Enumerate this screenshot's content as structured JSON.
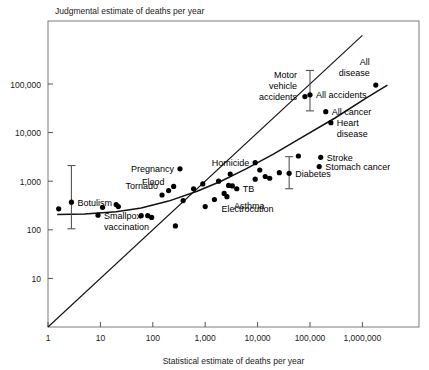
{
  "chart_data": {
    "type": "scatter",
    "title": "",
    "ylabel": "Judgmental estimate of deaths per year",
    "xlabel": "Statistical estimate of deaths per year",
    "xscale": "log",
    "yscale": "log",
    "xlim": [
      1,
      5000000
    ],
    "ylim": [
      1,
      1000000
    ],
    "grid": false,
    "legend": null,
    "xticks": [
      {
        "value": 1,
        "label": "1"
      },
      {
        "value": 10,
        "label": "10"
      },
      {
        "value": 100,
        "label": "100"
      },
      {
        "value": 1000,
        "label": "1,000"
      },
      {
        "value": 10000,
        "label": "10,000"
      },
      {
        "value": 100000,
        "label": "100,000"
      },
      {
        "value": 1000000,
        "label": "1,000,000"
      }
    ],
    "yticks": [
      {
        "value": 10,
        "label": "10"
      },
      {
        "value": 100,
        "label": "100"
      },
      {
        "value": 1000,
        "label": "1,000"
      },
      {
        "value": 10000,
        "label": "10,000"
      },
      {
        "value": 100000,
        "label": "100,000"
      }
    ],
    "reference_line": {
      "name": "identity-line",
      "from": [
        1,
        1
      ],
      "to": [
        1000000,
        1000000
      ]
    },
    "fit_curve": {
      "name": "fitted-curve",
      "points": [
        [
          1.5,
          205
        ],
        [
          5,
          212
        ],
        [
          20,
          235
        ],
        [
          60,
          280
        ],
        [
          200,
          390
        ],
        [
          700,
          620
        ],
        [
          2000,
          1000
        ],
        [
          6000,
          1800
        ],
        [
          20000,
          3600
        ],
        [
          70000,
          8000
        ],
        [
          300000,
          20000
        ],
        [
          1200000,
          52000
        ],
        [
          3000000,
          95000
        ]
      ]
    },
    "points": [
      {
        "x": 1.6,
        "y": 270,
        "label": ""
      },
      {
        "x": 2.8,
        "y": 370,
        "label": "Botulism",
        "label_pos": "right",
        "error_bar": {
          "low": 105,
          "high": 2100
        }
      },
      {
        "x": 11,
        "y": 290,
        "label": ""
      },
      {
        "x": 9,
        "y": 200,
        "label": "Smallpox vaccination",
        "label_pos": "right-2line"
      },
      {
        "x": 20,
        "y": 330,
        "label": ""
      },
      {
        "x": 22,
        "y": 300,
        "label": ""
      },
      {
        "x": 60,
        "y": 195,
        "label": ""
      },
      {
        "x": 80,
        "y": 195,
        "label": ""
      },
      {
        "x": 95,
        "y": 180,
        "label": ""
      },
      {
        "x": 150,
        "y": 520,
        "label": "Tornado",
        "label_pos": "above"
      },
      {
        "x": 200,
        "y": 640,
        "label": "Flood",
        "label_pos": "above"
      },
      {
        "x": 250,
        "y": 780,
        "label": ""
      },
      {
        "x": 330,
        "y": 1800,
        "label": "Pregnancy",
        "label_pos": "left"
      },
      {
        "x": 270,
        "y": 120,
        "label": ""
      },
      {
        "x": 380,
        "y": 400,
        "label": ""
      },
      {
        "x": 600,
        "y": 700,
        "label": ""
      },
      {
        "x": 900,
        "y": 880,
        "label": ""
      },
      {
        "x": 1000,
        "y": 300,
        "label": ""
      },
      {
        "x": 1800,
        "y": 1000,
        "label": ""
      },
      {
        "x": 2300,
        "y": 560,
        "label": ""
      },
      {
        "x": 2800,
        "y": 820,
        "label": ""
      },
      {
        "x": 3300,
        "y": 800,
        "label": ""
      },
      {
        "x": 4000,
        "y": 700,
        "label": "TB",
        "label_pos": "right"
      },
      {
        "x": 2600,
        "y": 480,
        "label": "Asthma",
        "label_pos": "below"
      },
      {
        "x": 1500,
        "y": 420,
        "label": "Electrocution",
        "label_pos": "below"
      },
      {
        "x": 3000,
        "y": 1400,
        "label": ""
      },
      {
        "x": 9000,
        "y": 2400,
        "label": "Homicide",
        "label_pos": "left"
      },
      {
        "x": 11000,
        "y": 1700,
        "label": ""
      },
      {
        "x": 9000,
        "y": 1100,
        "label": ""
      },
      {
        "x": 14000,
        "y": 1250,
        "label": ""
      },
      {
        "x": 17000,
        "y": 1150,
        "label": ""
      },
      {
        "x": 26000,
        "y": 1500,
        "label": ""
      },
      {
        "x": 40000,
        "y": 1450,
        "label": "Diabetes",
        "label_pos": "right",
        "error_bar": {
          "low": 700,
          "high": 3200
        }
      },
      {
        "x": 60000,
        "y": 3300,
        "label": ""
      },
      {
        "x": 80000,
        "y": 55000,
        "label": "Motor vehicle accidents",
        "label_pos": "left-3line"
      },
      {
        "x": 100000,
        "y": 60000,
        "label": "All accidents",
        "label_pos": "right",
        "error_bar": {
          "low": 28000,
          "high": 190000
        }
      },
      {
        "x": 160000,
        "y": 3100,
        "label": "Stroke",
        "label_pos": "right"
      },
      {
        "x": 200000,
        "y": 27000,
        "label": "All cancer",
        "label_pos": "right"
      },
      {
        "x": 250000,
        "y": 16000,
        "label": "Heart disease",
        "label_pos": "right-2line"
      },
      {
        "x": 150000,
        "y": 2000,
        "label": "Stomach cancer",
        "label_pos": "right"
      },
      {
        "x": 1800000,
        "y": 95000,
        "label": "All disease",
        "label_pos": "above-2line"
      }
    ]
  }
}
